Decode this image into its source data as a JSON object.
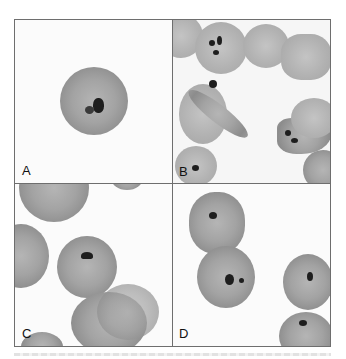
{
  "figure": {
    "panels": [
      {
        "id": "A",
        "label": "A",
        "content": "single round red cell with dark ring-shaped inclusion"
      },
      {
        "id": "B",
        "label": "B",
        "content": "several red cells including crescent/elongated forms with dark chromatin dots"
      },
      {
        "id": "C",
        "label": "C",
        "content": "red cells with one cell showing dark comma-shaped inclusion at periphery"
      },
      {
        "id": "D",
        "label": "D",
        "content": "clustered red cells with dark dot inclusions"
      }
    ]
  },
  "colors": {
    "border": "#6e6e6e",
    "cell": "#a3a3a3",
    "chromatin": "#1e1e1e",
    "background": "#ffffff"
  }
}
